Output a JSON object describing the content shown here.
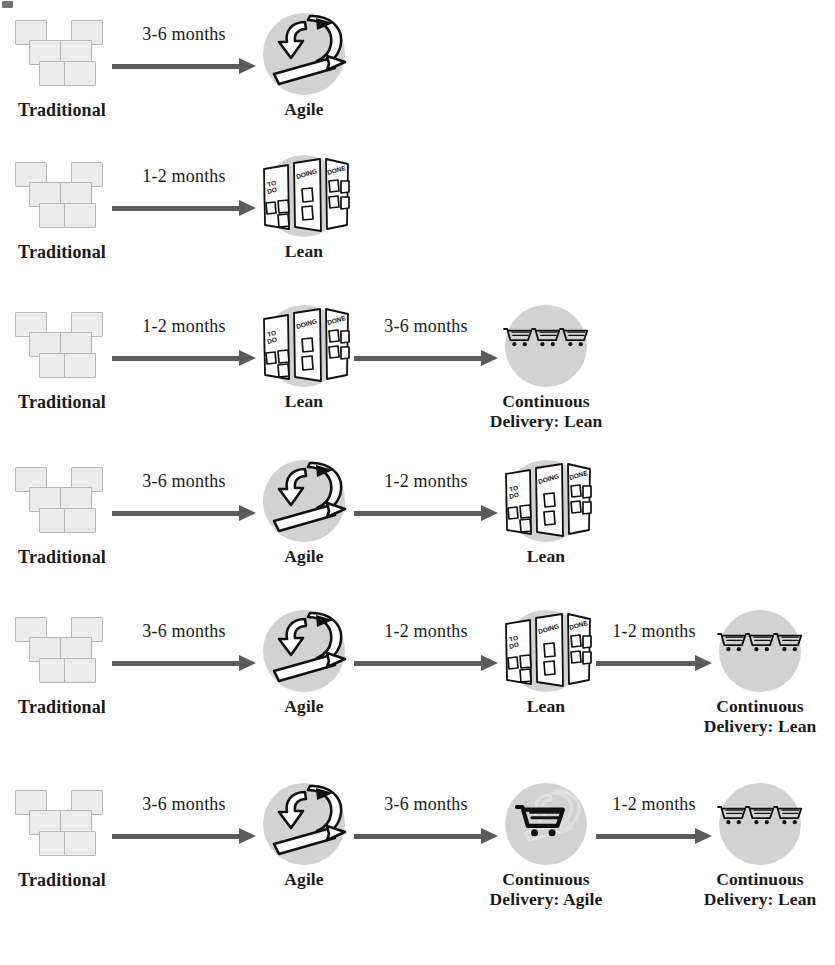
{
  "diagram": {
    "type": "flow",
    "colors": {
      "disc_gray": "#d2d2d2",
      "square_fill": "#ebebeb",
      "square_border": "#b6b6b6",
      "arrow_gray": "#5b5b5b",
      "text": "#1a1a1a",
      "background": "#ffffff"
    },
    "node_types": {
      "traditional": {
        "label": "Traditional",
        "icon": "stacked-squares-icon",
        "square_count": 6
      },
      "agile": {
        "label": "Agile",
        "icon": "agile-loop-arrow-icon"
      },
      "lean": {
        "label": "Lean",
        "icon": "kanban-board-icon",
        "columns": [
          "TO DO",
          "DOING",
          "DONE"
        ]
      },
      "cd_agile": {
        "label": "Continuous\nDelivery: Agile",
        "icon": "single-shopping-cart-icon",
        "cart_count": 1
      },
      "cd_lean": {
        "label": "Continuous\nDelivery: Lean",
        "icon": "three-shopping-carts-icon",
        "cart_count": 3
      }
    },
    "rows": [
      {
        "id": "row-1",
        "nodes": [
          {
            "type": "traditional",
            "label": "Traditional"
          },
          {
            "type": "agile",
            "label": "Agile"
          }
        ],
        "arrows": [
          {
            "label": "3-6 months"
          }
        ]
      },
      {
        "id": "row-2",
        "nodes": [
          {
            "type": "traditional",
            "label": "Traditional"
          },
          {
            "type": "lean",
            "label": "Lean"
          }
        ],
        "arrows": [
          {
            "label": "1-2 months"
          }
        ]
      },
      {
        "id": "row-3",
        "nodes": [
          {
            "type": "traditional",
            "label": "Traditional"
          },
          {
            "type": "lean",
            "label": "Lean"
          },
          {
            "type": "cd_lean",
            "label": "Continuous\nDelivery: Lean"
          }
        ],
        "arrows": [
          {
            "label": "1-2 months"
          },
          {
            "label": "3-6 months"
          }
        ]
      },
      {
        "id": "row-4",
        "nodes": [
          {
            "type": "traditional",
            "label": "Traditional"
          },
          {
            "type": "agile",
            "label": "Agile"
          },
          {
            "type": "lean",
            "label": "Lean"
          }
        ],
        "arrows": [
          {
            "label": "3-6 months"
          },
          {
            "label": "1-2 months"
          }
        ]
      },
      {
        "id": "row-5",
        "nodes": [
          {
            "type": "traditional",
            "label": "Traditional"
          },
          {
            "type": "agile",
            "label": "Agile"
          },
          {
            "type": "lean",
            "label": "Lean"
          },
          {
            "type": "cd_lean",
            "label": "Continuous\nDelivery: Lean"
          }
        ],
        "arrows": [
          {
            "label": "3-6 months"
          },
          {
            "label": "1-2 months"
          },
          {
            "label": "1-2 months"
          }
        ]
      },
      {
        "id": "row-6",
        "nodes": [
          {
            "type": "traditional",
            "label": "Traditional"
          },
          {
            "type": "agile",
            "label": "Agile"
          },
          {
            "type": "cd_agile",
            "label": "Continuous\nDelivery: Agile"
          },
          {
            "type": "cd_lean",
            "label": "Continuous\nDelivery: Lean"
          }
        ],
        "arrows": [
          {
            "label": "3-6 months"
          },
          {
            "label": "3-6 months"
          },
          {
            "label": "1-2 months"
          }
        ]
      }
    ]
  }
}
